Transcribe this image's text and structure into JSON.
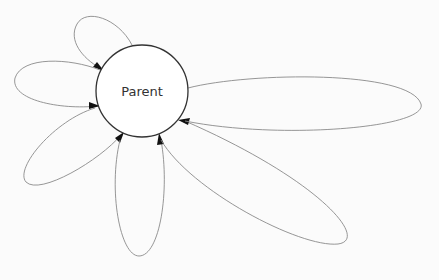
{
  "diagram": {
    "type": "graph",
    "nodes": [
      {
        "id": "parent",
        "label": "Parent",
        "shape": "circle"
      }
    ],
    "edges": [
      {
        "from": "parent",
        "to": "parent",
        "kind": "self-loop",
        "direction": "upper-left"
      },
      {
        "from": "parent",
        "to": "parent",
        "kind": "self-loop",
        "direction": "left"
      },
      {
        "from": "parent",
        "to": "parent",
        "kind": "self-loop",
        "direction": "lower-left"
      },
      {
        "from": "parent",
        "to": "parent",
        "kind": "self-loop",
        "direction": "down"
      },
      {
        "from": "parent",
        "to": "parent",
        "kind": "self-loop",
        "direction": "lower-right"
      },
      {
        "from": "parent",
        "to": "parent",
        "kind": "self-loop",
        "direction": "right"
      }
    ],
    "colors": {
      "background": "#fbfbfb",
      "node_stroke": "#333333",
      "edge_stroke": "#8a8a8a",
      "arrowhead": "#111111",
      "label": "#333333"
    }
  }
}
